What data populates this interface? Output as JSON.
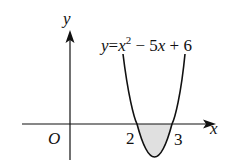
{
  "figure": {
    "equation": {
      "y": "y",
      "eq": "=",
      "x": "x",
      "exp": "2",
      "rest1": " − 5",
      "x2": "x",
      "rest2": " + 6"
    },
    "axes": {
      "x_label": "x",
      "y_label": "y",
      "origin_label": "O"
    },
    "roots": [
      "2",
      "3"
    ],
    "colors": {
      "stroke": "#111111",
      "shade": "#e0e0e0"
    }
  }
}
